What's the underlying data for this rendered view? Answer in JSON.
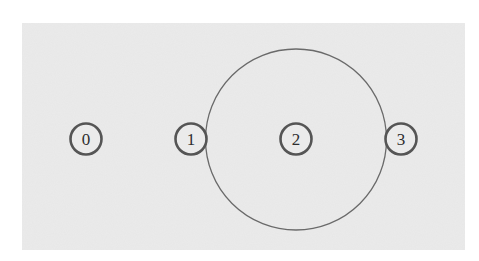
{
  "diagram": {
    "panel": {
      "x": 22,
      "y": 23,
      "width": 443,
      "height": 227,
      "fill": "#ebebeb"
    },
    "big_circle": {
      "cx": 296,
      "cy": 139.5,
      "r": 90.5,
      "stroke": "#6a6a6a",
      "stroke_width": 1.3
    },
    "node_style": {
      "r": 15.5,
      "stroke": "#555555",
      "stroke_width": 2.6,
      "fill": "#ebebeb"
    },
    "nodes": [
      {
        "id": "0",
        "label": "0",
        "cx": 86,
        "cy": 139
      },
      {
        "id": "1",
        "label": "1",
        "cx": 191,
        "cy": 139
      },
      {
        "id": "2",
        "label": "2",
        "cx": 296,
        "cy": 139
      },
      {
        "id": "3",
        "label": "3",
        "cx": 401,
        "cy": 139
      }
    ]
  }
}
